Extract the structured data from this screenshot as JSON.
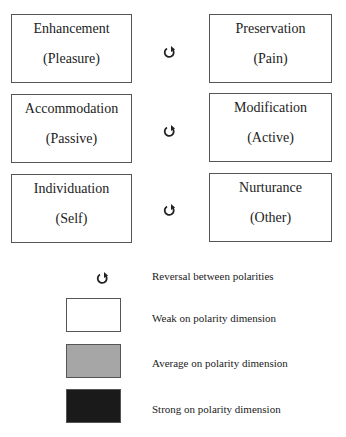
{
  "diagram": {
    "pairs": [
      {
        "left": {
          "title": "Enhancement",
          "sub": "(Pleasure)"
        },
        "right": {
          "title": "Preservation",
          "sub": "(Pain)"
        },
        "icon": "reversal-icon"
      },
      {
        "left": {
          "title": "Accommodation",
          "sub": "(Passive)"
        },
        "right": {
          "title": "Modification",
          "sub": "(Active)"
        },
        "icon": "reversal-icon"
      },
      {
        "left": {
          "title": "Individuation",
          "sub": "(Self)"
        },
        "right": {
          "title": "Nurturance",
          "sub": "(Other)"
        },
        "icon": "reversal-icon"
      }
    ]
  },
  "legend": {
    "items": [
      {
        "icon": "reversal-icon",
        "label": "Reversal between polarities"
      },
      {
        "swatch_color": "#ffffff",
        "label": "Weak on polarity dimension"
      },
      {
        "swatch_color": "#a6a6a6",
        "label": "Average on polarity dimension"
      },
      {
        "swatch_color": "#1a1a1a",
        "label": "Strong on polarity dimension"
      }
    ]
  }
}
